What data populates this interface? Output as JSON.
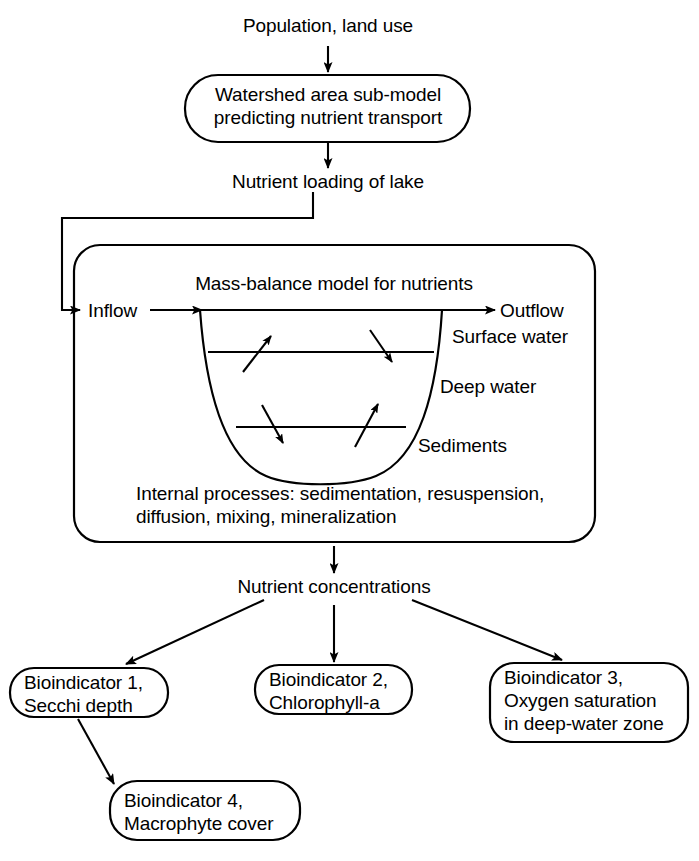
{
  "diagram": {
    "type": "flow-diagram",
    "stroke_color": "#000000",
    "background_color": "#ffffff",
    "nodes": {
      "population": {
        "label": "Population, land use",
        "shape": "plain-text"
      },
      "watershed_model": {
        "line1": "Watershed area sub-model",
        "line2": "predicting nutrient transport",
        "shape": "rounded-rectangle"
      },
      "nutrient_loading": {
        "label": "Nutrient loading of lake",
        "shape": "plain-text"
      },
      "lake_model": {
        "title": "Mass-balance model for nutrients",
        "inflow_label": "Inflow",
        "outflow_label": "Outflow",
        "layer_surface": "Surface water",
        "layer_deep": "Deep water",
        "layer_sediments": "Sediments",
        "internal_line1": "Internal processes: sedimentation, resuspension,",
        "internal_line2": "diffusion, mixing, mineralization",
        "shape": "rounded-rectangle"
      },
      "nutrient_concentrations": {
        "label": "Nutrient concentrations",
        "shape": "plain-text"
      },
      "bioindicator_1": {
        "line1": "Bioindicator 1,",
        "line2": "Secchi depth",
        "shape": "rounded-rectangle"
      },
      "bioindicator_2": {
        "line1": "Bioindicator 2,",
        "line2": "Chlorophyll-a",
        "shape": "rounded-rectangle"
      },
      "bioindicator_3": {
        "line1": "Bioindicator 3,",
        "line2": "Oxygen saturation",
        "line3": "in deep-water zone",
        "shape": "rounded-rectangle"
      },
      "bioindicator_4": {
        "line1": "Bioindicator 4,",
        "line2": "Macrophyte cover",
        "shape": "rounded-rectangle"
      }
    },
    "edges": [
      {
        "from": "population",
        "to": "watershed_model",
        "style": "straight-arrow"
      },
      {
        "from": "watershed_model",
        "to": "nutrient_loading",
        "style": "straight-arrow"
      },
      {
        "from": "nutrient_loading",
        "to": "lake_model",
        "style": "elbow-arrow-left-feedback"
      },
      {
        "from": "lake_model",
        "to": "nutrient_concentrations",
        "style": "straight-arrow"
      },
      {
        "from": "nutrient_concentrations",
        "to": "bioindicator_1",
        "style": "diagonal-arrow"
      },
      {
        "from": "nutrient_concentrations",
        "to": "bioindicator_2",
        "style": "straight-arrow"
      },
      {
        "from": "nutrient_concentrations",
        "to": "bioindicator_3",
        "style": "diagonal-arrow"
      },
      {
        "from": "bioindicator_1",
        "to": "bioindicator_4",
        "style": "diagonal-arrow"
      }
    ],
    "internal_flux_arrows": [
      {
        "name": "surface-to-deep-upward-left",
        "direction": "up-right"
      },
      {
        "name": "surface-to-deep-downward-right",
        "direction": "down-right"
      },
      {
        "name": "deep-to-sediment-downward-left",
        "direction": "down-right"
      },
      {
        "name": "sediment-to-deep-upward-right",
        "direction": "up-right"
      }
    ]
  }
}
